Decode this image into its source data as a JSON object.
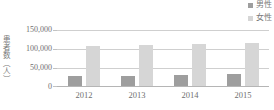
{
  "chart_data": {
    "type": "bar",
    "title": "",
    "subtitle": "",
    "xlabel": "",
    "ylabel": "患者数（人）",
    "categories": [
      "2012",
      "2013",
      "2014",
      "2015"
    ],
    "series": [
      {
        "name": "男性",
        "values": [
          28000,
          27000,
          28500,
          31000
        ],
        "color": "#9e9e9e"
      },
      {
        "name": "女性",
        "values": [
          107000,
          111000,
          113000,
          115000
        ],
        "color": "#d6d6d6"
      }
    ],
    "ylim": [
      0,
      150000
    ],
    "yticks": [
      0,
      50000,
      100000,
      150000
    ],
    "ytick_labels": [
      "0",
      "50,000",
      "100,000",
      "150,000"
    ],
    "grid": true,
    "legend_position": "top-right"
  },
  "legend": {
    "items": [
      {
        "label": "男性",
        "color": "#9e9e9e"
      },
      {
        "label": "女性",
        "color": "#d6d6d6"
      }
    ]
  },
  "axes": {
    "y_title": "患者数（人）",
    "y_tick_0": "0",
    "y_tick_1": "50,000",
    "y_tick_2": "100,000",
    "y_tick_3": "150,000",
    "x_tick_0": "2012",
    "x_tick_1": "2013",
    "x_tick_2": "2014",
    "x_tick_3": "2015"
  },
  "colors": {
    "male_bar": "#9e9e9e",
    "female_bar": "#d6d6d6",
    "gridline": "#cfcfcf",
    "axis": "#b5b5b5",
    "text": "#6f6f6f",
    "background": "#ffffff"
  }
}
